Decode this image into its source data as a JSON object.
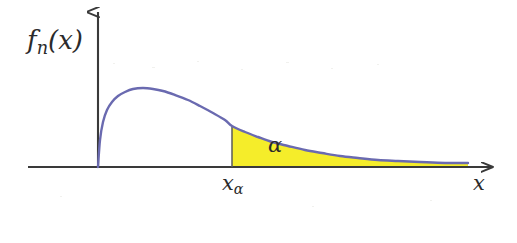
{
  "figure": {
    "background_color": "#ffffff",
    "width": 517,
    "height": 243
  },
  "labels": {
    "y_axis_label_function": "f",
    "y_axis_label_subscript": "n",
    "y_axis_label_argument": "(x)",
    "y_axis_label_full": "f_n(x)",
    "shaded_area_label": "α",
    "critical_value_base": "x",
    "critical_value_subscript": "α",
    "critical_value_full": "x_α",
    "x_axis_label": "x"
  },
  "colors": {
    "curve": "#6a6ab0",
    "fill": "#f5ed2a",
    "axis": "#3a3a3a",
    "text": "#2b2b2b",
    "background": "#ffffff"
  },
  "axes": {
    "origin_x": 98,
    "origin_y": 167,
    "x_axis_start": 28,
    "x_axis_end": 492,
    "y_axis_top": 10,
    "x_arrowhead": true,
    "y_arrowhead": true,
    "ticks_shown": false,
    "gridlines": false
  },
  "chart_data": {
    "type": "area",
    "title": "",
    "subtitle": "",
    "xlabel": "x",
    "ylabel": "f_n(x)",
    "xlim": [
      0,
      1
    ],
    "ylim": [
      0,
      1
    ],
    "grid": false,
    "legend_position": "none",
    "series": [
      {
        "name": "f_n(x)",
        "description": "right-skewed probability density (chi-square / gamma shape), rises steeply from the origin to a mode then decays with a long right tail",
        "color": "#6a6ab0",
        "points_px": [
          [
            98,
            167
          ],
          [
            100,
            140
          ],
          [
            103,
            122
          ],
          [
            107,
            110
          ],
          [
            112,
            102
          ],
          [
            118,
            96
          ],
          [
            125,
            92
          ],
          [
            133,
            89
          ],
          [
            143,
            88
          ],
          [
            153,
            89
          ],
          [
            163,
            91
          ],
          [
            175,
            95
          ],
          [
            188,
            100
          ],
          [
            200,
            106
          ],
          [
            213,
            113
          ],
          [
            225,
            120
          ],
          [
            232,
            126
          ],
          [
            245,
            132
          ],
          [
            258,
            137
          ],
          [
            272,
            142
          ],
          [
            288,
            146
          ],
          [
            305,
            150
          ],
          [
            322,
            153
          ],
          [
            340,
            156
          ],
          [
            358,
            158
          ],
          [
            378,
            160
          ],
          [
            398,
            161
          ],
          [
            420,
            162
          ],
          [
            445,
            163
          ],
          [
            468,
            163
          ]
        ]
      }
    ],
    "shaded_region": {
      "label": "α",
      "meaning": "upper-tail probability (significance level)",
      "color": "#f5ed2a",
      "x_start_px": 232,
      "x_end_px": 468,
      "baseline_y_px": 167,
      "boundary_label": "x_α",
      "boundary_is_vertical_line": true
    },
    "annotations": [
      {
        "text": "f_n(x)",
        "role": "y-axis-label",
        "x_px": 27,
        "y_px": 27
      },
      {
        "text": "α",
        "role": "shaded-area-label",
        "x_px": 268,
        "y_px": 135
      },
      {
        "text": "x_α",
        "role": "critical-value-label",
        "x_px": 222,
        "y_px": 173
      },
      {
        "text": "x",
        "role": "x-axis-label",
        "x_px": 473,
        "y_px": 173
      }
    ]
  }
}
